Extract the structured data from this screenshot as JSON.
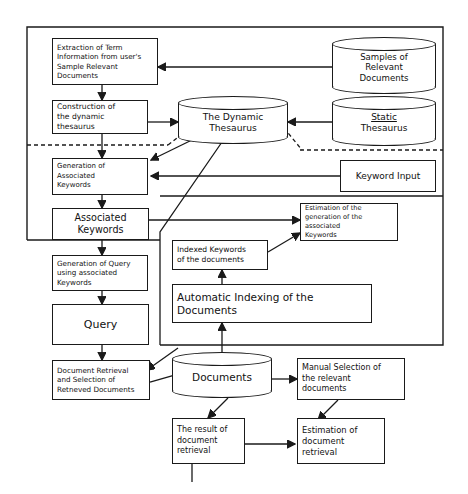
{
  "diagram": {
    "nodes": {
      "extraction": "Extraction of Term\nInformation from user's\nSample Relevant\nDocuments",
      "construction": "Construction of\nthe dynamic\nthesaurus",
      "generation_assoc": "Generation of\nAssociated\nKeywords",
      "associated_keywords": "Associated\nKeywords",
      "generation_query": "Generation of Query\nusing associated\nKeywords",
      "query": "Query",
      "document_retrieval": "Document Retrieval\nand Selection of\nRetneved Documents",
      "dynamic_thesaurus": "The Dynamic\nThesaurus",
      "samples_relevant": "Samples of\nRelevant\nDocuments",
      "static_thesaurus_line1": "Static",
      "static_thesaurus_line2": "Thesaurus",
      "keyword_input": "Keyword Input",
      "estimation_generation": "Estimation of the\ngeneration of the\nassociated\nKeywords",
      "indexed_keywords": "Indexed Keywords\nof the documents",
      "automatic_indexing": "Automatic Indexing of the\nDocuments",
      "documents": "Documents",
      "manual_selection": "Manual Selection of\nthe relevant\ndocuments",
      "result_retrieval": "The result of\ndocument\nretrieval",
      "estimation_retrieval": "Estimation of\ndocument\nretrieval"
    },
    "colors": {
      "stroke": "#1a1a1a",
      "background": "#ffffff"
    }
  }
}
